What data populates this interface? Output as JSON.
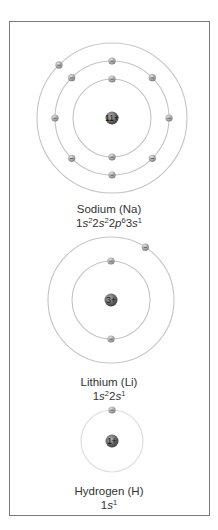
{
  "colors": {
    "frame": "#7a7a7a",
    "orbit": "#c4c4c4",
    "orbit_faint": "#dedede",
    "electron": "#9a9a9a",
    "nucleus": "#5a5a5a",
    "text": "#333333"
  },
  "atoms": [
    {
      "name": "Sodium (Na)",
      "nucleus_label": "11+",
      "config_parts": [
        {
          "t": "1",
          "style": "n"
        },
        {
          "t": "s",
          "style": "i"
        },
        {
          "t": "2",
          "style": "sup"
        },
        {
          "t": "2",
          "style": "n"
        },
        {
          "t": "s",
          "style": "i"
        },
        {
          "t": "2",
          "style": "sup"
        },
        {
          "t": "2",
          "style": "n"
        },
        {
          "t": "p",
          "style": "i"
        },
        {
          "t": "6",
          "style": "sup"
        },
        {
          "t": "3",
          "style": "n"
        },
        {
          "t": "s",
          "style": "i"
        },
        {
          "t": "1",
          "style": "sup"
        }
      ],
      "config_text": "1s²2s²2p⁶3s¹",
      "center": [
        112,
        118
      ],
      "shells": [
        {
          "radius": 39,
          "electrons": 2,
          "angles": [
            -90,
            90
          ]
        },
        {
          "radius": 57,
          "electrons": 8,
          "angles": [
            -90,
            -45,
            0,
            45,
            90,
            135,
            180,
            225
          ]
        },
        {
          "radius": 75,
          "electrons": 1,
          "angles": [
            -135
          ]
        }
      ]
    },
    {
      "name": "Lithium (Li)",
      "nucleus_label": "3+",
      "config_parts": [
        {
          "t": "1",
          "style": "n"
        },
        {
          "t": "s",
          "style": "i"
        },
        {
          "t": "2",
          "style": "sup"
        },
        {
          "t": "2",
          "style": "n"
        },
        {
          "t": "s",
          "style": "i"
        },
        {
          "t": "1",
          "style": "sup"
        }
      ],
      "config_text": "1s²2s¹",
      "center": [
        111,
        300
      ],
      "shells": [
        {
          "radius": 39,
          "electrons": 2,
          "angles": [
            -90,
            90
          ]
        },
        {
          "radius": 63,
          "electrons": 1,
          "angles": [
            -57
          ]
        }
      ]
    },
    {
      "name": "Hydrogen (H)",
      "nucleus_label": "1+",
      "config_parts": [
        {
          "t": "1",
          "style": "n"
        },
        {
          "t": "s",
          "style": "i"
        },
        {
          "t": "1",
          "style": "sup"
        }
      ],
      "config_text": "1s¹",
      "center": [
        112,
        441
      ],
      "shells": [
        {
          "radius": 31,
          "electrons": 1,
          "angles": [
            -90
          ],
          "faint": true
        }
      ]
    }
  ],
  "labels": {
    "sodium_name": "Sodium (Na)",
    "lithium_name": "Lithium (Li)",
    "hydrogen_name": "Hydrogen (H)"
  }
}
